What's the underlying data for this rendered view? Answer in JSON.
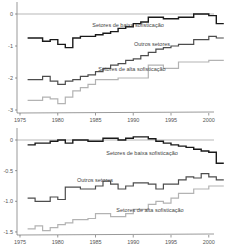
{
  "colors": {
    "baixa": "#1a1a1a",
    "outros": "#4d4d4d",
    "alta": "#b3b3b3",
    "axis": "#555555",
    "zero_line": "#888888"
  },
  "chart_data": [
    {
      "type": "line",
      "step": true,
      "title": "",
      "xlabel": "",
      "ylabel": "",
      "x_ticks": [
        "1975",
        "1980",
        "1985",
        "1990",
        "1995",
        "2000"
      ],
      "y_ticks": [
        "0",
        "-1",
        "-2",
        "-3"
      ],
      "ylim": [
        -3,
        0.2
      ],
      "xlim": [
        1975,
        2001.5
      ],
      "grid": false,
      "x": [
        1976,
        1977,
        1978,
        1979,
        1980,
        1981,
        1982,
        1983,
        1984,
        1985,
        1986,
        1987,
        1988,
        1989,
        1990,
        1991,
        1992,
        1993,
        1994,
        1995,
        1996,
        1997,
        1998,
        1999,
        2000,
        2001
      ],
      "series": [
        {
          "name": "Setores de baixa sofisticação",
          "values": [
            -0.75,
            -0.75,
            -0.85,
            -0.8,
            -0.95,
            -1.05,
            -0.75,
            -0.7,
            -0.7,
            -0.65,
            -0.6,
            -0.55,
            -0.45,
            -0.4,
            -0.3,
            -0.25,
            -0.1,
            -0.1,
            -0.15,
            -0.15,
            -0.1,
            -0.1,
            0.0,
            0.0,
            -0.05,
            -0.3
          ]
        },
        {
          "name": "Outros setores",
          "values": [
            -2.05,
            -2.05,
            -1.95,
            -2.1,
            -2.2,
            -2.1,
            -2.05,
            -1.95,
            -1.9,
            -1.8,
            -1.7,
            -1.6,
            -1.55,
            -1.45,
            -1.4,
            -1.3,
            -1.2,
            -1.1,
            -1.05,
            -1.0,
            -0.95,
            -0.95,
            -0.8,
            -0.8,
            -0.7,
            -0.75
          ]
        },
        {
          "name": "Setores de alta sofisticação",
          "values": [
            -2.7,
            -2.7,
            -2.6,
            -2.65,
            -2.8,
            -2.6,
            -2.4,
            -2.3,
            -2.2,
            -2.05,
            -2.05,
            -2.05,
            -2.0,
            -2.0,
            -2.0,
            -2.0,
            -1.6,
            -1.6,
            -1.7,
            -1.7,
            -1.5,
            -1.5,
            -1.5,
            -1.5,
            -1.45,
            -1.45
          ]
        }
      ],
      "annotations": [
        {
          "text": "Setores de baixa sofisticação",
          "x": 1990,
          "y": -0.45
        },
        {
          "text": "Outros setores",
          "x": 1992,
          "y": -1.3
        },
        {
          "text": "Setores de alta sofisticação",
          "x": 1991,
          "y": -2.05
        }
      ]
    },
    {
      "type": "line",
      "step": true,
      "title": "",
      "xlabel": "",
      "ylabel": "",
      "x_ticks": [
        "1975",
        "1980",
        "1985",
        "1990",
        "1995",
        "2000"
      ],
      "y_ticks": [
        "0",
        "-0.5",
        "-1.0",
        "-1.5"
      ],
      "ylim": [
        -1.5,
        0.1
      ],
      "xlim": [
        1975,
        2001.5
      ],
      "grid": false,
      "x": [
        1976,
        1977,
        1978,
        1979,
        1980,
        1981,
        1982,
        1983,
        1984,
        1985,
        1986,
        1987,
        1988,
        1989,
        1990,
        1991,
        1992,
        1993,
        1994,
        1995,
        1996,
        1997,
        1998,
        1999,
        2000,
        2001
      ],
      "series": [
        {
          "name": "Setores de baixa sofisticação",
          "values": [
            -0.08,
            -0.05,
            -0.05,
            -0.02,
            0.0,
            -0.05,
            0.0,
            0.0,
            -0.02,
            -0.02,
            0.03,
            0.03,
            0.0,
            0.03,
            0.05,
            0.05,
            0.02,
            -0.02,
            -0.05,
            -0.08,
            -0.1,
            -0.12,
            -0.15,
            -0.18,
            -0.2,
            -0.38
          ]
        },
        {
          "name": "Outros setores",
          "values": [
            -0.95,
            -1.0,
            -1.0,
            -0.93,
            -0.97,
            -0.77,
            -0.77,
            -0.8,
            -0.8,
            -0.75,
            -0.67,
            -0.72,
            -0.8,
            -0.75,
            -0.7,
            -0.7,
            -0.72,
            -0.8,
            -0.72,
            -0.72,
            -0.65,
            -0.6,
            -0.62,
            -0.55,
            -0.6,
            -0.65
          ]
        },
        {
          "name": "Setores de alta sofisticação",
          "values": [
            -1.45,
            -1.4,
            -1.48,
            -1.43,
            -1.38,
            -1.35,
            -1.3,
            -1.3,
            -1.28,
            -1.2,
            -1.2,
            -1.25,
            -1.25,
            -1.2,
            -1.13,
            -1.13,
            -1.05,
            -1.0,
            -1.03,
            -0.95,
            -0.87,
            -0.87,
            -0.8,
            -0.8,
            -0.75,
            -0.75
          ]
        }
      ],
      "annotations": [
        {
          "text": "Setores de baixa sofisticação",
          "x": 1993,
          "y": -0.25
        },
        {
          "text": "Outros setores",
          "x": 1986,
          "y": -0.85
        },
        {
          "text": "Setores de alta sofisticação",
          "x": 1992,
          "y": -1.25
        }
      ]
    }
  ]
}
